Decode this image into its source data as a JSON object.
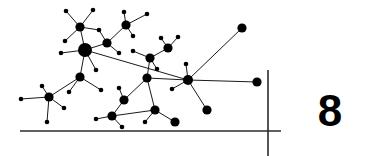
{
  "figure": {
    "type": "node-link-network-diagram",
    "caption_number": "8",
    "background_color": "#ffffff",
    "ink_color": "#000000",
    "edge_color": "#1a1a1a",
    "axis_color": "#2b2b2b",
    "width": 371,
    "height": 156
  },
  "axes": {
    "horizontal": {
      "x1": 20,
      "y1": 131,
      "x2": 281,
      "y2": 131,
      "stroke_width": 1.6
    },
    "vertical": {
      "x1": 268,
      "y1": 70,
      "x2": 268,
      "y2": 156,
      "stroke_width": 1.6
    }
  },
  "graph": {
    "node_sizes": {
      "hub": 7.0,
      "large": 4.6,
      "medium": 3.4,
      "small": 2.3
    },
    "edge_width": 1.0,
    "nodes": [
      {
        "id": "n01",
        "x": 66,
        "y": 11,
        "r": 2.3
      },
      {
        "id": "n02",
        "x": 93,
        "y": 10,
        "r": 2.3
      },
      {
        "id": "n03",
        "x": 80,
        "y": 27,
        "r": 4.6
      },
      {
        "id": "n04",
        "x": 65,
        "y": 41,
        "r": 2.3
      },
      {
        "id": "n05",
        "x": 99,
        "y": 30,
        "r": 2.3
      },
      {
        "id": "n06",
        "x": 124,
        "y": 12,
        "r": 2.3
      },
      {
        "id": "n07",
        "x": 147,
        "y": 14,
        "r": 2.3
      },
      {
        "id": "n08",
        "x": 126,
        "y": 25,
        "r": 4.6
      },
      {
        "id": "n09",
        "x": 133,
        "y": 36,
        "r": 2.3
      },
      {
        "id": "n10",
        "x": 107,
        "y": 43,
        "r": 4.6
      },
      {
        "id": "n11",
        "x": 85,
        "y": 50,
        "r": 7.0
      },
      {
        "id": "n12",
        "x": 61,
        "y": 53,
        "r": 2.3
      },
      {
        "id": "n13",
        "x": 119,
        "y": 53,
        "r": 2.3
      },
      {
        "id": "n14",
        "x": 96,
        "y": 70,
        "r": 2.3
      },
      {
        "id": "n15",
        "x": 80,
        "y": 77,
        "r": 4.6
      },
      {
        "id": "n16",
        "x": 69,
        "y": 92,
        "r": 2.3
      },
      {
        "id": "n17",
        "x": 49,
        "y": 97,
        "r": 4.6
      },
      {
        "id": "n18",
        "x": 42,
        "y": 86,
        "r": 2.3
      },
      {
        "id": "n19",
        "x": 21,
        "y": 99,
        "r": 2.3
      },
      {
        "id": "n20",
        "x": 64,
        "y": 108,
        "r": 2.3
      },
      {
        "id": "n21",
        "x": 47,
        "y": 122,
        "r": 2.3
      },
      {
        "id": "n22",
        "x": 101,
        "y": 90,
        "r": 2.3
      },
      {
        "id": "n23",
        "x": 124,
        "y": 100,
        "r": 4.6
      },
      {
        "id": "n24",
        "x": 119,
        "y": 88,
        "r": 2.3
      },
      {
        "id": "n25",
        "x": 112,
        "y": 116,
        "r": 4.6
      },
      {
        "id": "n26",
        "x": 96,
        "y": 119,
        "r": 2.3
      },
      {
        "id": "n27",
        "x": 122,
        "y": 127,
        "r": 2.3
      },
      {
        "id": "n28",
        "x": 150,
        "y": 58,
        "r": 4.6
      },
      {
        "id": "n29",
        "x": 168,
        "y": 48,
        "r": 4.6
      },
      {
        "id": "n30",
        "x": 161,
        "y": 38,
        "r": 2.3
      },
      {
        "id": "n31",
        "x": 178,
        "y": 37,
        "r": 2.3
      },
      {
        "id": "n32",
        "x": 157,
        "y": 69,
        "r": 2.3
      },
      {
        "id": "n33",
        "x": 133,
        "y": 51,
        "r": 2.3
      },
      {
        "id": "n34",
        "x": 147,
        "y": 78,
        "r": 4.6
      },
      {
        "id": "n35",
        "x": 155,
        "y": 110,
        "r": 4.6
      },
      {
        "id": "n36",
        "x": 145,
        "y": 122,
        "r": 2.3
      },
      {
        "id": "n37",
        "x": 175,
        "y": 122,
        "r": 4.6
      },
      {
        "id": "n38",
        "x": 188,
        "y": 80,
        "r": 5.0
      },
      {
        "id": "n39",
        "x": 186,
        "y": 64,
        "r": 2.3
      },
      {
        "id": "n40",
        "x": 172,
        "y": 89,
        "r": 2.3
      },
      {
        "id": "n41",
        "x": 207,
        "y": 110,
        "r": 4.6
      },
      {
        "id": "n42",
        "x": 242,
        "y": 28,
        "r": 4.6
      },
      {
        "id": "n43",
        "x": 257,
        "y": 82,
        "r": 4.6
      }
    ],
    "edges": [
      [
        "n03",
        "n01"
      ],
      [
        "n03",
        "n02"
      ],
      [
        "n03",
        "n04"
      ],
      [
        "n03",
        "n05"
      ],
      [
        "n03",
        "n11"
      ],
      [
        "n05",
        "n10"
      ],
      [
        "n08",
        "n06"
      ],
      [
        "n08",
        "n07"
      ],
      [
        "n08",
        "n09"
      ],
      [
        "n08",
        "n10"
      ],
      [
        "n10",
        "n11"
      ],
      [
        "n10",
        "n13"
      ],
      [
        "n11",
        "n12"
      ],
      [
        "n11",
        "n14"
      ],
      [
        "n11",
        "n15"
      ],
      [
        "n11",
        "n38"
      ],
      [
        "n15",
        "n16"
      ],
      [
        "n15",
        "n17"
      ],
      [
        "n15",
        "n22"
      ],
      [
        "n17",
        "n18"
      ],
      [
        "n17",
        "n19"
      ],
      [
        "n17",
        "n20"
      ],
      [
        "n17",
        "n21"
      ],
      [
        "n23",
        "n24"
      ],
      [
        "n23",
        "n25"
      ],
      [
        "n23",
        "n34"
      ],
      [
        "n25",
        "n26"
      ],
      [
        "n25",
        "n27"
      ],
      [
        "n25",
        "n35"
      ],
      [
        "n28",
        "n29"
      ],
      [
        "n28",
        "n33"
      ],
      [
        "n28",
        "n34"
      ],
      [
        "n28",
        "n32"
      ],
      [
        "n29",
        "n30"
      ],
      [
        "n29",
        "n31"
      ],
      [
        "n34",
        "n35"
      ],
      [
        "n34",
        "n38"
      ],
      [
        "n35",
        "n36"
      ],
      [
        "n35",
        "n37"
      ],
      [
        "n38",
        "n39"
      ],
      [
        "n38",
        "n40"
      ],
      [
        "n38",
        "n41"
      ],
      [
        "n38",
        "n42"
      ],
      [
        "n38",
        "n43"
      ]
    ]
  }
}
